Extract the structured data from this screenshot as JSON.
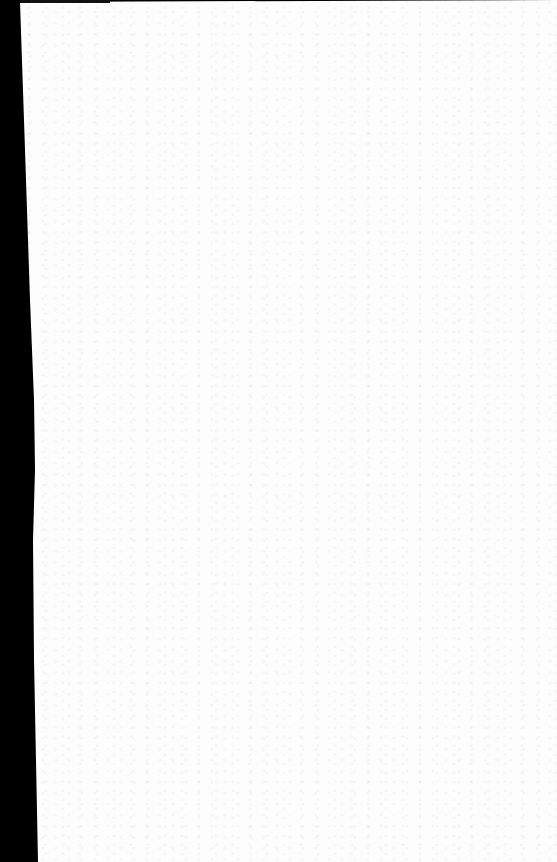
{
  "document": {
    "type": "scanned-blank-page",
    "text": "",
    "colors": {
      "page": "#fdfdfd",
      "border": "#000000"
    }
  }
}
